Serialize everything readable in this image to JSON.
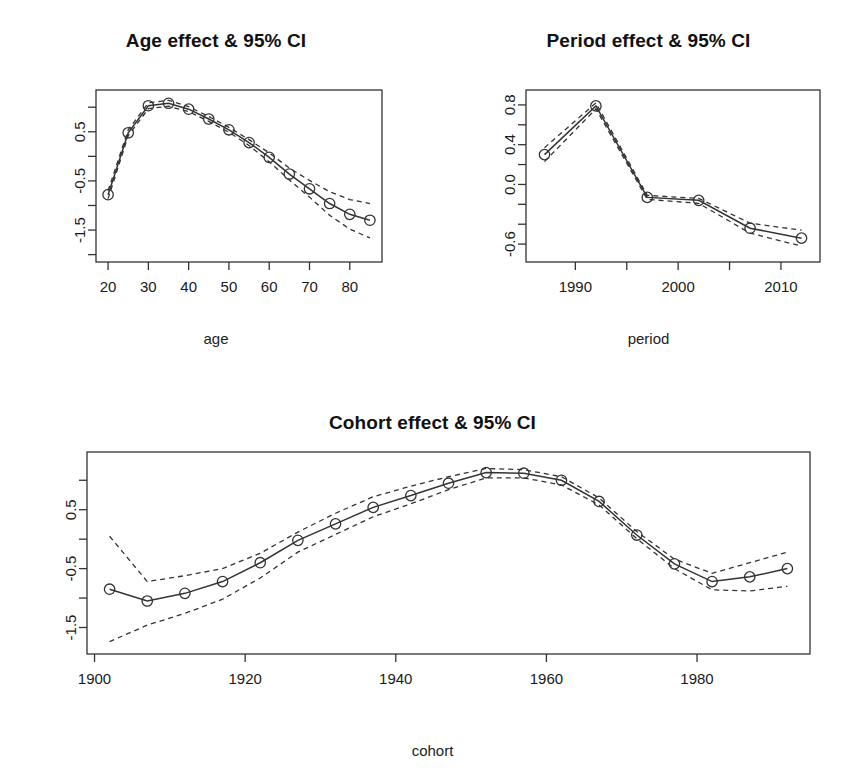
{
  "figure": {
    "background": "#ffffff",
    "line_color": "#333333",
    "ci_color": "#333333",
    "point_symbol": "open-circle"
  },
  "chart_data": [
    {
      "id": "age",
      "type": "line",
      "title": "Age effect & 95% CI",
      "xlabel": "age",
      "ylabel": "",
      "xlim": [
        17,
        88
      ],
      "ylim": [
        -2.15,
        1.35
      ],
      "xticks": [
        20,
        30,
        40,
        50,
        60,
        70,
        80
      ],
      "xticklabels": [
        "20",
        "30",
        "40",
        "50",
        "60",
        "70",
        "80"
      ],
      "yticks": [
        1.0,
        0.5,
        0.0,
        -0.5,
        -1.0,
        -1.5,
        -2.0
      ],
      "yticklabels": [
        "",
        "0.5",
        "",
        "-0.5",
        "",
        "-1.5",
        ""
      ],
      "grid": false,
      "legend": null,
      "x": [
        20,
        25,
        30,
        35,
        40,
        45,
        50,
        55,
        60,
        65,
        70,
        75,
        80,
        85
      ],
      "series": [
        {
          "name": "estimate",
          "style": "solid",
          "values": [
            -0.78,
            0.48,
            1.03,
            1.08,
            0.96,
            0.76,
            0.54,
            0.28,
            -0.02,
            -0.36,
            -0.66,
            -0.96,
            -1.18,
            -1.3
          ]
        },
        {
          "name": "upper 95% CI",
          "style": "dashed",
          "values": [
            -0.7,
            0.54,
            1.09,
            1.14,
            1.01,
            0.81,
            0.59,
            0.34,
            0.07,
            -0.24,
            -0.49,
            -0.72,
            -0.88,
            -0.96
          ]
        },
        {
          "name": "lower 95% CI",
          "style": "dashed",
          "values": [
            -0.86,
            0.42,
            0.97,
            1.02,
            0.91,
            0.71,
            0.49,
            0.22,
            -0.11,
            -0.48,
            -0.83,
            -1.2,
            -1.48,
            -1.66
          ]
        }
      ]
    },
    {
      "id": "period",
      "type": "line",
      "title": "Period effect & 95% CI",
      "xlabel": "period",
      "ylabel": "",
      "xlim": [
        1985.2,
        2013.8
      ],
      "ylim": [
        -0.78,
        0.95
      ],
      "xticks": [
        1990,
        1995,
        2000,
        2005,
        2010
      ],
      "xticklabels": [
        "1990",
        "",
        "2000",
        "",
        "2010"
      ],
      "yticks": [
        0.8,
        0.6,
        0.4,
        0.2,
        0.0,
        -0.2,
        -0.4,
        -0.6
      ],
      "yticklabels": [
        "0.8",
        "",
        "0.4",
        "",
        "0.0",
        "",
        "",
        "-0.6"
      ],
      "grid": false,
      "legend": null,
      "x": [
        1987,
        1992,
        1997,
        2002,
        2007,
        2012
      ],
      "series": [
        {
          "name": "estimate",
          "style": "solid",
          "values": [
            0.3,
            0.79,
            -0.13,
            -0.16,
            -0.44,
            -0.54
          ]
        },
        {
          "name": "upper 95% CI",
          "style": "dashed",
          "values": [
            0.37,
            0.82,
            -0.11,
            -0.14,
            -0.39,
            -0.46
          ]
        },
        {
          "name": "lower 95% CI",
          "style": "dashed",
          "values": [
            0.23,
            0.76,
            -0.15,
            -0.19,
            -0.49,
            -0.62
          ]
        }
      ]
    },
    {
      "id": "cohort",
      "type": "line",
      "title": "Cohort effect & 95% CI",
      "xlabel": "cohort",
      "ylabel": "",
      "xlim": [
        1899,
        1995
      ],
      "ylim": [
        -1.95,
        1.48
      ],
      "xticks": [
        1900,
        1920,
        1940,
        1960,
        1980
      ],
      "xticklabels": [
        "1900",
        "1920",
        "1940",
        "1960",
        "1980"
      ],
      "yticks": [
        1.0,
        0.5,
        0.0,
        -0.5,
        -1.0,
        -1.5
      ],
      "yticklabels": [
        "",
        "0.5",
        "",
        "-0.5",
        "",
        "-1.5"
      ],
      "grid": false,
      "legend": null,
      "x": [
        1902,
        1907,
        1912,
        1917,
        1922,
        1927,
        1932,
        1937,
        1942,
        1947,
        1952,
        1957,
        1962,
        1967,
        1972,
        1977,
        1982,
        1987,
        1992
      ],
      "series": [
        {
          "name": "estimate",
          "style": "solid",
          "values": [
            -0.85,
            -1.05,
            -0.92,
            -0.72,
            -0.4,
            -0.02,
            0.26,
            0.54,
            0.74,
            0.95,
            1.13,
            1.12,
            1.0,
            0.64,
            0.07,
            -0.42,
            -0.72,
            -0.64,
            -0.5
          ]
        },
        {
          "name": "upper 95% CI",
          "style": "dashed",
          "values": [
            0.05,
            -0.72,
            -0.62,
            -0.5,
            -0.24,
            0.12,
            0.44,
            0.72,
            0.9,
            1.06,
            1.2,
            1.18,
            1.06,
            0.7,
            0.13,
            -0.34,
            -0.58,
            -0.4,
            -0.22
          ]
        },
        {
          "name": "lower 95% CI",
          "style": "dashed",
          "values": [
            -1.74,
            -1.46,
            -1.26,
            -1.02,
            -0.66,
            -0.22,
            0.08,
            0.38,
            0.6,
            0.84,
            1.04,
            1.04,
            0.92,
            0.58,
            0.01,
            -0.5,
            -0.86,
            -0.88,
            -0.8
          ]
        }
      ]
    }
  ]
}
